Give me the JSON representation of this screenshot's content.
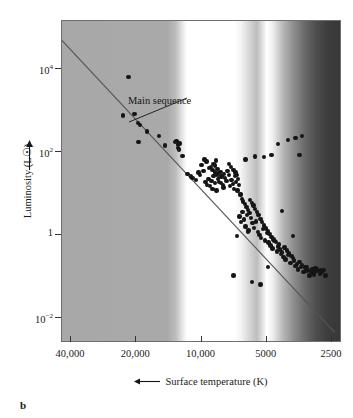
{
  "figure": {
    "panel_letter": "b",
    "annotation": {
      "label": "Main sequence",
      "leader_from": [
        126,
        78
      ],
      "leader_to": [
        68,
        102
      ]
    }
  },
  "chart_data": {
    "type": "scatter",
    "title": "",
    "xlabel": "Surface temperature (K)",
    "ylabel": "Luminosity (L☉)",
    "xlabel_arrow": "left",
    "ylabel_arrow": "up",
    "x_scale": "log-reversed",
    "y_scale": "log",
    "xlim": [
      44000,
      2250
    ],
    "ylim": [
      0.0025,
      140000
    ],
    "x_ticks": [
      {
        "value": 40000,
        "label": "40,000"
      },
      {
        "value": 20000,
        "label": "20,000"
      },
      {
        "value": 10000,
        "label": "10,000"
      },
      {
        "value": 5000,
        "label": "5000"
      },
      {
        "value": 2500,
        "label": "2500"
      }
    ],
    "y_ticks": [
      {
        "value": 10000,
        "mantissa": "10",
        "exponent": "4"
      },
      {
        "value": 100,
        "mantissa": "10",
        "exponent": "2"
      },
      {
        "value": 1,
        "mantissa": "1",
        "exponent": ""
      },
      {
        "value": 0.01,
        "mantissa": "10",
        "exponent": "−2"
      }
    ],
    "grid": false,
    "legend": "none",
    "background": "stellar-spectrum-gradient",
    "series": [
      {
        "name": "Main sequence line",
        "type": "line",
        "color": "#555555",
        "points": [
          [
            44000,
            48000
          ],
          [
            2400,
            0.0042
          ]
        ]
      },
      {
        "name": "Stars",
        "type": "scatter",
        "color": "#151515",
        "marker": "circle",
        "points": [
          [
            21500,
            6000
          ],
          [
            22800,
            700
          ],
          [
            20200,
            760
          ],
          [
            19400,
            470
          ],
          [
            19000,
            420
          ],
          [
            19300,
            160
          ],
          [
            17600,
            290
          ],
          [
            15500,
            230
          ],
          [
            14600,
            135
          ],
          [
            13100,
            165
          ],
          [
            12900,
            170
          ],
          [
            12700,
            140
          ],
          [
            12500,
            150
          ],
          [
            12700,
            115
          ],
          [
            12600,
            108
          ],
          [
            12100,
            75
          ],
          [
            11500,
            28
          ],
          [
            11100,
            24
          ],
          [
            10900,
            22
          ],
          [
            10500,
            20
          ],
          [
            10200,
            30
          ],
          [
            10050,
            26
          ],
          [
            9900,
            45
          ],
          [
            9700,
            33
          ],
          [
            9500,
            18
          ],
          [
            9350,
            15
          ],
          [
            9200,
            21
          ],
          [
            9050,
            14
          ],
          [
            8900,
            19
          ],
          [
            8800,
            12
          ],
          [
            8700,
            25
          ],
          [
            8600,
            17
          ],
          [
            8450,
            11
          ],
          [
            9600,
            62
          ],
          [
            9400,
            55
          ],
          [
            9150,
            38
          ],
          [
            8950,
            41
          ],
          [
            8800,
            35
          ],
          [
            8700,
            48
          ],
          [
            8550,
            30
          ],
          [
            8400,
            26
          ],
          [
            8300,
            21
          ],
          [
            8200,
            18
          ],
          [
            8100,
            31
          ],
          [
            8000,
            24
          ],
          [
            7900,
            15
          ],
          [
            7850,
            13
          ],
          [
            8600,
            44
          ],
          [
            8500,
            58
          ],
          [
            8350,
            36
          ],
          [
            8250,
            29
          ],
          [
            8150,
            23
          ],
          [
            8050,
            17
          ],
          [
            7800,
            28
          ],
          [
            7700,
            22
          ],
          [
            7600,
            19
          ],
          [
            7500,
            33
          ],
          [
            7400,
            26
          ],
          [
            7300,
            14
          ],
          [
            7200,
            20
          ],
          [
            7100,
            16
          ],
          [
            7000,
            12
          ],
          [
            6950,
            25
          ],
          [
            6850,
            18
          ],
          [
            6750,
            11
          ],
          [
            6650,
            15
          ],
          [
            6550,
            9
          ],
          [
            7400,
            48
          ],
          [
            7250,
            40
          ],
          [
            7050,
            35
          ],
          [
            6900,
            30
          ],
          [
            6800,
            26
          ],
          [
            6700,
            21
          ],
          [
            6600,
            2.6
          ],
          [
            6500,
            1.9
          ],
          [
            6400,
            3.4
          ],
          [
            6300,
            2.2
          ],
          [
            6200,
            1.5
          ],
          [
            6100,
            2.8
          ],
          [
            6000,
            1.2
          ],
          [
            6550,
            8.5
          ],
          [
            6450,
            7.0
          ],
          [
            6350,
            6.0
          ],
          [
            6250,
            5.2
          ],
          [
            6150,
            4.4
          ],
          [
            6050,
            3.8
          ],
          [
            5950,
            3.2
          ],
          [
            5850,
            2.4
          ],
          [
            5750,
            1.8
          ],
          [
            5650,
            1.4
          ],
          [
            5550,
            2.0
          ],
          [
            5450,
            1.1
          ],
          [
            5900,
            6.5
          ],
          [
            5800,
            5.5
          ],
          [
            5700,
            4.8
          ],
          [
            5600,
            4.0
          ],
          [
            5500,
            3.4
          ],
          [
            5400,
            2.8
          ],
          [
            5350,
            0.95
          ],
          [
            5250,
            0.8
          ],
          [
            5150,
            1.3
          ],
          [
            5050,
            0.7
          ],
          [
            4950,
            1.05
          ],
          [
            4850,
            0.62
          ],
          [
            5300,
            2.3
          ],
          [
            5200,
            1.9
          ],
          [
            5100,
            1.6
          ],
          [
            5000,
            1.35
          ],
          [
            4900,
            1.15
          ],
          [
            4800,
            0.98
          ],
          [
            4750,
            0.52
          ],
          [
            4650,
            0.44
          ],
          [
            4550,
            0.68
          ],
          [
            4450,
            0.38
          ],
          [
            4350,
            0.55
          ],
          [
            4250,
            0.33
          ],
          [
            4700,
            0.85
          ],
          [
            4600,
            0.74
          ],
          [
            4500,
            0.63
          ],
          [
            4400,
            0.5
          ],
          [
            4300,
            0.42
          ],
          [
            4200,
            0.36
          ],
          [
            4150,
            0.28
          ],
          [
            4050,
            0.24
          ],
          [
            3950,
            0.31
          ],
          [
            3850,
            0.2
          ],
          [
            3750,
            0.26
          ],
          [
            3650,
            0.17
          ],
          [
            4100,
            0.47
          ],
          [
            4000,
            0.4
          ],
          [
            3900,
            0.34
          ],
          [
            3800,
            0.29
          ],
          [
            3700,
            0.23
          ],
          [
            3600,
            0.19
          ],
          [
            3550,
            0.14
          ],
          [
            3450,
            0.16
          ],
          [
            3350,
            0.12
          ],
          [
            3250,
            0.13
          ],
          [
            3150,
            0.1
          ],
          [
            3050,
            0.115
          ],
          [
            3500,
            0.21
          ],
          [
            3400,
            0.18
          ],
          [
            3300,
            0.155
          ],
          [
            3200,
            0.135
          ],
          [
            3100,
            0.125
          ],
          [
            3000,
            0.105
          ],
          [
            2950,
            0.15
          ],
          [
            2880,
            0.13
          ],
          [
            2820,
            0.11
          ],
          [
            2760,
            0.12
          ],
          [
            2700,
            0.135
          ],
          [
            2650,
            0.1
          ],
          [
            3950,
            180
          ],
          [
            3650,
            200
          ],
          [
            3400,
            230
          ],
          [
            3500,
            80
          ],
          [
            4400,
            145
          ],
          [
            4700,
            78
          ],
          [
            5100,
            70
          ],
          [
            5600,
            72
          ],
          [
            6200,
            62
          ],
          [
            6050,
            1.1
          ],
          [
            4200,
            3.6
          ],
          [
            3750,
            0.9
          ],
          [
            4900,
            0.16
          ],
          [
            5300,
            0.06
          ],
          [
            6800,
            0.9
          ],
          [
            7050,
            0.1
          ],
          [
            5800,
            0.07
          ],
          [
            3250,
            0.16
          ],
          [
            2900,
            0.14
          ],
          [
            2780,
            0.135
          ],
          [
            3050,
            0.145
          ],
          [
            2980,
            0.12
          ]
        ]
      }
    ]
  }
}
